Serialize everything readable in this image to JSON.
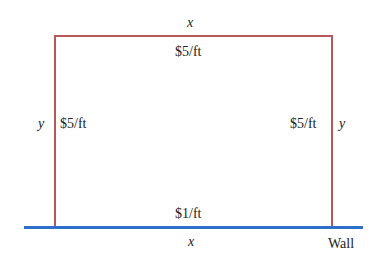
{
  "diagram": {
    "fence_color": "#b5585c",
    "wall_color": "#2e6fc9",
    "top": {
      "dimension": "x",
      "cost": "$5/ft"
    },
    "left": {
      "dimension": "y",
      "cost": "$5/ft"
    },
    "right": {
      "dimension": "y",
      "cost": "$5/ft"
    },
    "bottom": {
      "dimension": "x",
      "cost": "$1/ft"
    },
    "wall_label": "Wall"
  }
}
